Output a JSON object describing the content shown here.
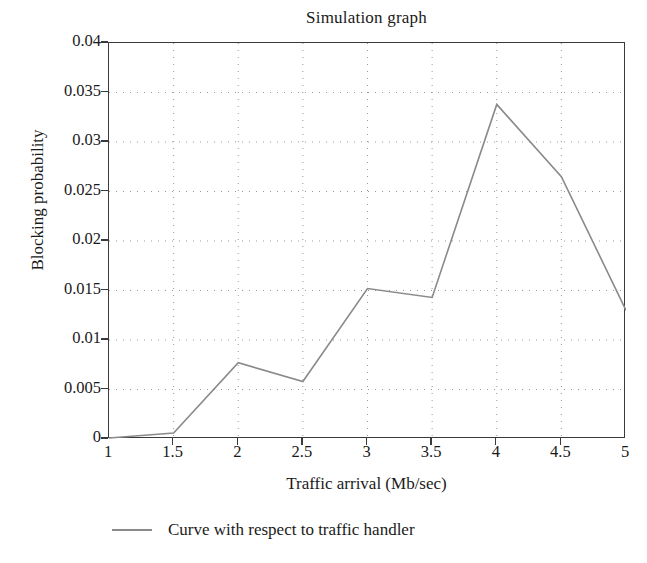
{
  "chart_data": {
    "type": "line",
    "title": "Simulation graph",
    "xlabel": "Traffic arrival (Mb/sec)",
    "ylabel": "Blocking probability",
    "x": [
      1,
      1.5,
      2,
      2.5,
      3,
      3.5,
      4,
      4.5,
      5
    ],
    "series": [
      {
        "name": "Curve with respect to traffic handler",
        "color": "#8a8a8a",
        "values": [
          0.0001,
          0.0006,
          0.0077,
          0.0058,
          0.0152,
          0.0143,
          0.0338,
          0.0265,
          0.013
        ]
      }
    ],
    "xlim": [
      1,
      5
    ],
    "ylim": [
      0,
      0.04
    ],
    "xticks": [
      1,
      1.5,
      2,
      2.5,
      3,
      3.5,
      4,
      4.5,
      5
    ],
    "xticklabels": [
      "1",
      "1.5",
      "2",
      "2.5",
      "3",
      "3.5",
      "4",
      "4.5",
      "5"
    ],
    "yticks": [
      0,
      0.005,
      0.01,
      0.015,
      0.02,
      0.025,
      0.03,
      0.035,
      0.04
    ],
    "yticklabels": [
      "0",
      "0.005",
      "0.01",
      "0.015",
      "0.02",
      "0.025",
      "0.03",
      "0.035",
      "0.04"
    ],
    "grid": true,
    "grid_style": "dotted",
    "grid_color": "#9a9a9a",
    "legend_position": "below-axis-left",
    "axis_color": "#3a3a3a",
    "background": "#ffffff"
  },
  "legend": {
    "entries": [
      {
        "label": "Curve with respect to traffic handler",
        "color": "#8a8a8a"
      }
    ]
  }
}
